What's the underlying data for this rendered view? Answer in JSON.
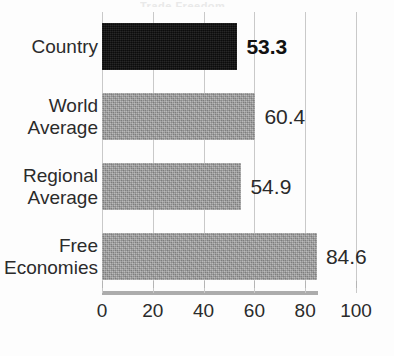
{
  "chart_data": {
    "type": "bar",
    "orientation": "horizontal",
    "title": "",
    "xlabel": "",
    "ylabel": "",
    "xlim": [
      0,
      100
    ],
    "xticks": [
      "0",
      "20",
      "40",
      "60",
      "80",
      "100"
    ],
    "grid": true,
    "legend": "none",
    "categories": [
      "Country",
      "World Average",
      "Regional Average",
      "Free Economies"
    ],
    "values": [
      53.3,
      54.9,
      60.4,
      84.6
    ],
    "bars": [
      {
        "category": "Country",
        "label_lines": "Country",
        "value": 53.3,
        "value_label": "53.3",
        "color": "#121212",
        "style": "black",
        "emphasis": true
      },
      {
        "category": "World Average",
        "label_lines": "World\nAverage",
        "value": 60.4,
        "value_label": "60.4",
        "color": "#9b9b9b",
        "style": "gray",
        "emphasis": false
      },
      {
        "category": "Regional Average",
        "label_lines": "Regional\nAverage",
        "value": 54.9,
        "value_label": "54.9",
        "color": "#9b9b9b",
        "style": "gray",
        "emphasis": false
      },
      {
        "category": "Free Economies",
        "label_lines": "Free\nEconomies",
        "value": 84.6,
        "value_label": "84.6",
        "color": "#9b9b9b",
        "style": "gray",
        "emphasis": false
      }
    ]
  },
  "axis": {
    "ticks": [
      {
        "label": "0",
        "value": 0
      },
      {
        "label": "20",
        "value": 20
      },
      {
        "label": "40",
        "value": 40
      },
      {
        "label": "60",
        "value": 60
      },
      {
        "label": "80",
        "value": 80
      },
      {
        "label": "100",
        "value": 100
      }
    ]
  },
  "title_remnant": {
    "text": "Trade Freedom"
  },
  "colors": {
    "bar_gray": "#9b9b9b",
    "bar_black": "#121212",
    "gridline": "#c9c9c9",
    "baseline": "#9e9e9e",
    "text": "#2b2b2b",
    "background": "#fdfdfd"
  }
}
